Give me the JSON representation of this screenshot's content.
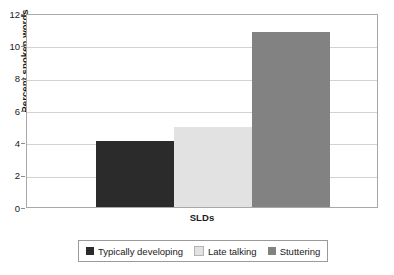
{
  "chart_data": {
    "type": "bar",
    "title": "",
    "subtitle": "",
    "xlabel": "SLDs",
    "ylabel": "Percent spoken words",
    "categories": [
      "SLDs"
    ],
    "xtick_labels": [
      "SLDs"
    ],
    "ylim": [
      0,
      12
    ],
    "ytick_labels": [
      "12",
      "10",
      "8",
      "6",
      "4",
      "2",
      "0"
    ],
    "ytick_values": [
      12,
      10,
      8,
      6,
      4,
      2,
      0
    ],
    "grid": "horizontal",
    "legend_position": "bottom",
    "annotations": [],
    "series": [
      {
        "name": "Typically developing",
        "values": [
          4.1
        ],
        "color": "#2b2b2b"
      },
      {
        "name": "Late talking",
        "values": [
          4.95
        ],
        "color": "#e2e2e2"
      },
      {
        "name": "Stuttering",
        "values": [
          10.8
        ],
        "color": "#828282"
      }
    ]
  },
  "legend": {
    "entries": [
      {
        "label": "Typically developing",
        "color": "#2b2b2b"
      },
      {
        "label": "Late talking",
        "color": "#e2e2e2"
      },
      {
        "label": "Stuttering",
        "color": "#828282"
      }
    ]
  },
  "colors": {
    "plot_background": "#ffffff",
    "plot_border": "#a8a8a8",
    "gridline": "#d2d2d2",
    "tick_mark": "#8c8c8c",
    "text": "#1a1a1a",
    "legend_border": "#9a9a9a",
    "bar_typically_developing": "#2b2b2b",
    "bar_late_talking": "#e2e2e2",
    "bar_stuttering": "#828282"
  }
}
